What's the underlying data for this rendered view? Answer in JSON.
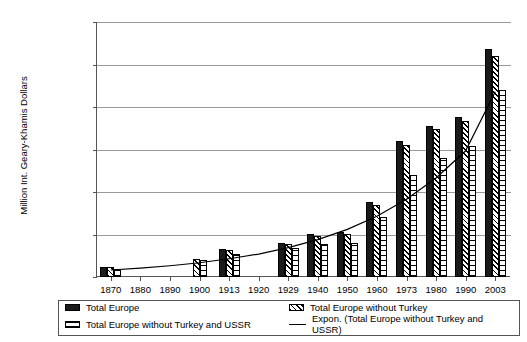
{
  "chart_data": {
    "type": "bar",
    "title": "",
    "xlabel": "",
    "ylabel": "Million Int. Geary-Khamis Dollars",
    "ylim": [
      0,
      12000000
    ],
    "ytick_labels": [
      "12,000,000",
      "10,000,000",
      "8,000,000",
      "6,000,000",
      "4,000,000",
      "2,000,000",
      "0"
    ],
    "ytick_values": [
      12000000,
      10000000,
      8000000,
      6000000,
      4000000,
      2000000,
      0
    ],
    "grid": true,
    "legend_position": "bottom",
    "categories": [
      "1870",
      "1880",
      "1890",
      "1900",
      "1913",
      "1920",
      "1929",
      "1940",
      "1950",
      "1960",
      "1973",
      "1980",
      "1990",
      "2003"
    ],
    "series": [
      {
        "name": "Total Europe",
        "pattern": "solid-black",
        "values": [
          480000,
          null,
          null,
          null,
          1300000,
          null,
          1620000,
          2020000,
          2100000,
          3520000,
          6380000,
          7120000,
          7520000,
          10750000
        ]
      },
      {
        "name": "Total Europe without Turkey",
        "pattern": "diagonal-hatch",
        "values": [
          460000,
          null,
          null,
          860000,
          1260000,
          null,
          1560000,
          1940000,
          2020000,
          3400000,
          6220000,
          6950000,
          7320000,
          10400000
        ]
      },
      {
        "name": "Total Europe without Turkey and USSR",
        "pattern": "grid-hatch",
        "values": [
          400000,
          null,
          null,
          780000,
          1080000,
          null,
          1380000,
          1560000,
          1620000,
          2820000,
          4780000,
          5620000,
          6180000,
          8800000
        ]
      }
    ],
    "trendline": {
      "name": "Expon. (Total Europe without Turkey and USSR)",
      "style": "solid-thin-black",
      "points": [
        {
          "x": "1870",
          "y": 330000
        },
        {
          "x": "1880",
          "y": 420000
        },
        {
          "x": "1890",
          "y": 530000
        },
        {
          "x": "1900",
          "y": 670000
        },
        {
          "x": "1913",
          "y": 860000
        },
        {
          "x": "1920",
          "y": 1080000
        },
        {
          "x": "1929",
          "y": 1380000
        },
        {
          "x": "1940",
          "y": 1760000
        },
        {
          "x": "1950",
          "y": 2240000
        },
        {
          "x": "1960",
          "y": 2860000
        },
        {
          "x": "1973",
          "y": 3660000
        },
        {
          "x": "1980",
          "y": 4660000
        },
        {
          "x": "1990",
          "y": 5940000
        },
        {
          "x": "2003",
          "y": 8720000
        }
      ]
    }
  },
  "legend": {
    "items": [
      {
        "label": "Total Europe",
        "swatch": "solid-black-swatch"
      },
      {
        "label": "Total Europe without Turkey",
        "swatch": "diagonal-hatch-swatch"
      },
      {
        "label": "Total Europe without Turkey and USSR",
        "swatch": "grid-hatch-swatch"
      },
      {
        "label": "Expon. (Total Europe without Turkey and USSR)",
        "swatch": "line-swatch"
      }
    ]
  },
  "colors": {
    "series_total": "#1a1a1a",
    "gridline": "#9a9a9a",
    "axis": "#555555",
    "background": "#ffffff"
  }
}
